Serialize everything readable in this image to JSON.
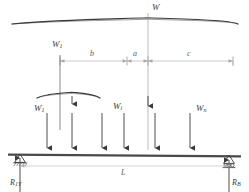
{
  "diagram": {
    "type": "engineering-free-body-diagram",
    "colors": {
      "line": "#3a3a3a",
      "dim_line": "#b4b4b4",
      "beam": "#4a4a4a",
      "background": "#ffffff"
    },
    "resultant_load": {
      "label": "W",
      "sub": "",
      "x": 148,
      "brace_left": 12,
      "brace_right": 238
    },
    "point_loads": [
      {
        "label": "W",
        "sub": "1",
        "show_label": true,
        "x": 47,
        "label_x": 34,
        "label_y": 106
      },
      {
        "label": "W",
        "sub": "",
        "show_label": false,
        "x": 72,
        "label_x": 0,
        "label_y": 0
      },
      {
        "label": "W",
        "sub": "",
        "show_label": false,
        "x": 102,
        "label_x": 0,
        "label_y": 0
      },
      {
        "label": "W",
        "sub": "i",
        "show_label": true,
        "x": 124,
        "label_x": 113,
        "label_y": 104
      },
      {
        "label": "W",
        "sub": "",
        "show_label": false,
        "x": 155,
        "label_x": 0,
        "label_y": 0
      },
      {
        "label": "W",
        "sub": "n",
        "show_label": true,
        "x": 190,
        "label_x": 196,
        "label_y": 106
      }
    ],
    "secondary_brace": {
      "left": 37,
      "right": 100,
      "center": 72,
      "y": 92
    },
    "dimensions": [
      {
        "label": "b",
        "from": 60,
        "to": 127,
        "label_x": 90,
        "label_y": 51
      },
      {
        "label": "a",
        "from": 127,
        "to": 148,
        "label_x": 133,
        "label_y": 51
      },
      {
        "label": "c",
        "from": 148,
        "to": 233,
        "label_x": 187,
        "label_y": 51
      }
    ],
    "span_dimension": {
      "label": "L",
      "from": 20,
      "to": 229,
      "y": 166,
      "label_x": 121,
      "label_y": 170
    },
    "supports": [
      {
        "name": "pin",
        "x": 20,
        "y": 155,
        "reaction_label": "R",
        "reaction_sub": "1Y",
        "reaction_label_x": 14,
        "reaction_label_y": 180
      },
      {
        "name": "roller",
        "x": 229,
        "y": 155,
        "reaction_label": "R",
        "reaction_sub": "B",
        "reaction_label_x": 227,
        "reaction_label_y": 180
      }
    ],
    "beam": {
      "left": 8,
      "right": 241,
      "y": 155
    }
  }
}
